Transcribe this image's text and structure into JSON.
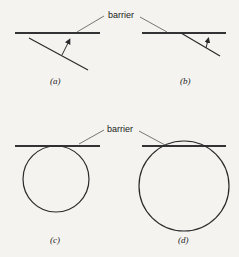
{
  "labels": {
    "barrier_top": "barrier",
    "barrier_bottom": "barrier"
  },
  "captions": {
    "a": "(a)",
    "b": "(b)",
    "c": "(c)",
    "d": "(d)"
  },
  "colors": {
    "background": "#f4f3f0",
    "line": "#2a2a2a",
    "barrier": "#333333"
  }
}
